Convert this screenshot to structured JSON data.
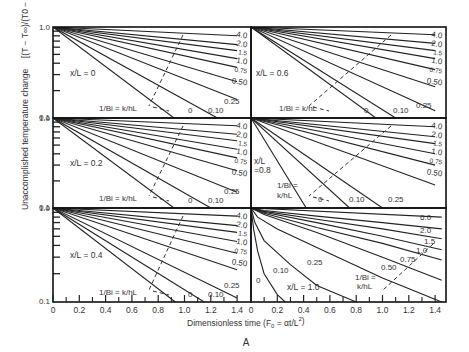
{
  "chart_data": {
    "type": "line",
    "figure_label": "A",
    "xlabel": "Dimensionless time (F0 = αt/L²)",
    "ylabel": "Unaccomplished temperature change [(T − T∞)/(T0 − T∞)]",
    "x_ticks": [
      "0",
      "0.2",
      "0.4",
      "0.6",
      "0.8",
      "1.0",
      "1.2",
      "1.4"
    ],
    "xlim": [
      0,
      1.4
    ],
    "y_scale": "log",
    "ylim": [
      0.1,
      1.0
    ],
    "y_tick_labels": [
      "1.0",
      "0.1"
    ],
    "legend_param": "1/Bi = k/hL",
    "panels": [
      {
        "position": "top-left",
        "position_label": "x/L = 0",
        "curve_labels": [
          "4.0",
          "2.0",
          "1.5",
          "1.0",
          "0.75",
          "0.50",
          "0.25",
          "0.10",
          "0"
        ],
        "series": [
          {
            "name": "0",
            "x": [
              0,
              0.92
            ],
            "y": [
              1.0,
              0.1
            ]
          },
          {
            "name": "0.10",
            "x": [
              0,
              1.25
            ],
            "y": [
              1.0,
              0.1
            ]
          },
          {
            "name": "0.25",
            "x": [
              0,
              1.4
            ],
            "y": [
              1.0,
              0.16
            ]
          },
          {
            "name": "0.50",
            "x": [
              0,
              1.4
            ],
            "y": [
              1.0,
              0.25
            ]
          },
          {
            "name": "0.75",
            "x": [
              0,
              1.4
            ],
            "y": [
              1.0,
              0.36
            ]
          },
          {
            "name": "1.0",
            "x": [
              0,
              1.4
            ],
            "y": [
              1.0,
              0.45
            ]
          },
          {
            "name": "1.5",
            "x": [
              0,
              1.4
            ],
            "y": [
              1.0,
              0.55
            ]
          },
          {
            "name": "2.0",
            "x": [
              0,
              1.4
            ],
            "y": [
              1.0,
              0.64
            ]
          },
          {
            "name": "4.0",
            "x": [
              0,
              1.4
            ],
            "y": [
              1.0,
              0.8
            ]
          }
        ]
      },
      {
        "position": "top-right",
        "position_label": "x/L = 0.6",
        "curve_labels": [
          "4.0",
          "2.0",
          "1.5",
          "1.0",
          "0.75",
          "0.50",
          "0.25",
          "0.10",
          "0"
        ],
        "series": [
          {
            "name": "0",
            "x": [
              0,
              0.95
            ],
            "y": [
              1.0,
              0.1
            ]
          },
          {
            "name": "0.10",
            "x": [
              0,
              1.1
            ],
            "y": [
              1.0,
              0.1
            ]
          },
          {
            "name": "0.25",
            "x": [
              0,
              1.4
            ],
            "y": [
              1.0,
              0.12
            ]
          },
          {
            "name": "0.50",
            "x": [
              0,
              1.4
            ],
            "y": [
              1.0,
              0.22
            ]
          },
          {
            "name": "0.75",
            "x": [
              0,
              1.4
            ],
            "y": [
              1.0,
              0.34
            ]
          },
          {
            "name": "1.0",
            "x": [
              0,
              1.4
            ],
            "y": [
              1.0,
              0.45
            ]
          },
          {
            "name": "1.5",
            "x": [
              0,
              1.4
            ],
            "y": [
              1.0,
              0.55
            ]
          },
          {
            "name": "2.0",
            "x": [
              0,
              1.4
            ],
            "y": [
              1.0,
              0.66
            ]
          },
          {
            "name": "4.0",
            "x": [
              0,
              1.4
            ],
            "y": [
              1.0,
              0.82
            ]
          }
        ]
      },
      {
        "position": "middle-left",
        "position_label": "x/L = 0.2",
        "curve_labels": [
          "4.0",
          "2.0",
          "1.5",
          "1.0",
          "0.75",
          "0.50",
          "0.25",
          "0.10",
          "0"
        ],
        "series": [
          {
            "name": "0",
            "x": [
              0,
              0.92
            ],
            "y": [
              1.0,
              0.1
            ]
          },
          {
            "name": "0.10",
            "x": [
              0,
              1.2
            ],
            "y": [
              1.0,
              0.1
            ]
          },
          {
            "name": "0.25",
            "x": [
              0,
              1.4
            ],
            "y": [
              1.0,
              0.15
            ]
          },
          {
            "name": "0.50",
            "x": [
              0,
              1.4
            ],
            "y": [
              1.0,
              0.26
            ]
          },
          {
            "name": "0.75",
            "x": [
              0,
              1.4
            ],
            "y": [
              1.0,
              0.36
            ]
          },
          {
            "name": "1.0",
            "x": [
              0,
              1.4
            ],
            "y": [
              1.0,
              0.45
            ]
          },
          {
            "name": "1.5",
            "x": [
              0,
              1.4
            ],
            "y": [
              1.0,
              0.56
            ]
          },
          {
            "name": "2.0",
            "x": [
              0,
              1.4
            ],
            "y": [
              1.0,
              0.66
            ]
          },
          {
            "name": "4.0",
            "x": [
              0,
              1.4
            ],
            "y": [
              1.0,
              0.82
            ]
          }
        ]
      },
      {
        "position": "middle-right",
        "position_label": "x/L = 0.8",
        "curve_labels": [
          "4.0",
          "2.0",
          "1.5",
          "1.0",
          "0.75",
          "0.50",
          "0.25",
          "0.10",
          "0"
        ],
        "series": [
          {
            "name": "0",
            "x": [
              0,
              0.42
            ],
            "y": [
              1.0,
              0.1
            ]
          },
          {
            "name": "0.10",
            "x": [
              0,
              0.75
            ],
            "y": [
              1.0,
              0.1
            ]
          },
          {
            "name": "0.25",
            "x": [
              0,
              1.0
            ],
            "y": [
              1.0,
              0.1
            ]
          },
          {
            "name": "0.50",
            "x": [
              0,
              1.4
            ],
            "y": [
              1.0,
              0.18
            ]
          },
          {
            "name": "0.75",
            "x": [
              0,
              1.4
            ],
            "y": [
              1.0,
              0.3
            ]
          },
          {
            "name": "1.0",
            "x": [
              0,
              1.4
            ],
            "y": [
              1.0,
              0.4
            ]
          },
          {
            "name": "1.5",
            "x": [
              0,
              1.4
            ],
            "y": [
              1.0,
              0.52
            ]
          },
          {
            "name": "2.0",
            "x": [
              0,
              1.4
            ],
            "y": [
              1.0,
              0.62
            ]
          },
          {
            "name": "4.0",
            "x": [
              0,
              1.4
            ],
            "y": [
              1.0,
              0.8
            ]
          }
        ]
      },
      {
        "position": "bottom-left",
        "position_label": "x/L = 0.4",
        "curve_labels": [
          "4.0",
          "2.0",
          "1.5",
          "1.0",
          "0.75",
          "0.50",
          "0.25",
          "0.10",
          "0"
        ],
        "series": [
          {
            "name": "0",
            "x": [
              0,
              0.93
            ],
            "y": [
              1.0,
              0.1
            ]
          },
          {
            "name": "0.10",
            "x": [
              0,
              1.15
            ],
            "y": [
              1.0,
              0.1
            ]
          },
          {
            "name": "0.25",
            "x": [
              0,
              1.4
            ],
            "y": [
              1.0,
              0.11
            ]
          },
          {
            "name": "0.50",
            "x": [
              0,
              1.4
            ],
            "y": [
              1.0,
              0.22
            ]
          },
          {
            "name": "0.75",
            "x": [
              0,
              1.4
            ],
            "y": [
              1.0,
              0.33
            ]
          },
          {
            "name": "1.0",
            "x": [
              0,
              1.4
            ],
            "y": [
              1.0,
              0.44
            ]
          },
          {
            "name": "1.5",
            "x": [
              0,
              1.4
            ],
            "y": [
              1.0,
              0.55
            ]
          },
          {
            "name": "2.0",
            "x": [
              0,
              1.4
            ],
            "y": [
              1.0,
              0.65
            ]
          },
          {
            "name": "4.0",
            "x": [
              0,
              1.4
            ],
            "y": [
              1.0,
              0.82
            ]
          }
        ]
      },
      {
        "position": "bottom-right",
        "position_label": "x/L = 1.0",
        "curve_labels": [
          "6.0",
          "2.0",
          "1.5",
          "1.0",
          "0.75",
          "0.50",
          "0.25",
          "0.10",
          "0"
        ],
        "series": [
          {
            "name": "0",
            "x": [
              0,
              0.02,
              0.05,
              0.1,
              0.2,
              0.26
            ],
            "y": [
              1.0,
              0.6,
              0.35,
              0.2,
              0.12,
              0.1
            ]
          },
          {
            "name": "0.10",
            "x": [
              0,
              0.03,
              0.1,
              0.3,
              0.5,
              0.8
            ],
            "y": [
              1.0,
              0.7,
              0.45,
              0.25,
              0.15,
              0.1
            ]
          },
          {
            "name": "0.25",
            "x": [
              0,
              0.05,
              0.2,
              0.5,
              1.0,
              1.45
            ],
            "y": [
              1.0,
              0.8,
              0.6,
              0.38,
              0.18,
              0.1
            ]
          },
          {
            "name": "0.50",
            "x": [
              0,
              0.1,
              0.5,
              1.0,
              1.45
            ],
            "y": [
              1.0,
              0.85,
              0.55,
              0.3,
              0.17
            ]
          },
          {
            "name": "0.75",
            "x": [
              0,
              0.1,
              0.5,
              1.0,
              1.45
            ],
            "y": [
              1.0,
              0.88,
              0.62,
              0.42,
              0.28
            ]
          },
          {
            "name": "1.0",
            "x": [
              0,
              0.1,
              0.5,
              1.0,
              1.45
            ],
            "y": [
              1.0,
              0.9,
              0.7,
              0.5,
              0.36
            ]
          },
          {
            "name": "1.5",
            "x": [
              0,
              0.1,
              0.5,
              1.0,
              1.45
            ],
            "y": [
              1.0,
              0.92,
              0.76,
              0.6,
              0.47
            ]
          },
          {
            "name": "2.0",
            "x": [
              0,
              0.1,
              0.5,
              1.0,
              1.45
            ],
            "y": [
              1.0,
              0.94,
              0.82,
              0.7,
              0.6
            ]
          },
          {
            "name": "6.0",
            "x": [
              0,
              1.45
            ],
            "y": [
              1.0,
              0.8
            ]
          }
        ]
      }
    ],
    "grid": false,
    "legend_position": "inline curve labels"
  },
  "axis": {
    "ylabel_text": "Unaccomplished temperature change",
    "ylabel_formula": "[(T − T∞)/(T0 − T∞)]",
    "xlabel_text": "Dimensionless time (F",
    "xlabel_sub": "0",
    "xlabel_tail": " = αt/L",
    "xlabel_sup": "2",
    "xlabel_close": ")",
    "y_top": "1.0",
    "y_bottom": "0.1"
  },
  "figure_label": "A",
  "bi_label": "1/Bi = k/hL",
  "bi_label_line1": "1/Bi =",
  "bi_label_line2": "k/hL"
}
